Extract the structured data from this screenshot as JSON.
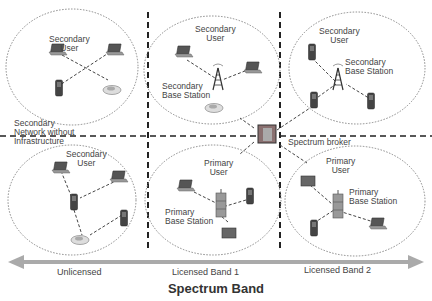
{
  "diagram": {
    "title": "Spectrum Band",
    "bands": [
      "Unlicensed",
      "Licensed Band 1",
      "Licensed Band 2"
    ],
    "cells": [
      {
        "id": "top-left",
        "label": "Secondary User",
        "devices": [
          "laptop",
          "laptop",
          "phone",
          "car"
        ]
      },
      {
        "id": "top-center",
        "label": "Secondary User",
        "station_label": "Secondary Base Station",
        "devices": [
          "laptop",
          "laptop",
          "car"
        ]
      },
      {
        "id": "top-right",
        "label": "Secondary User",
        "station_label": "Secondary Base Station",
        "devices": [
          "phone",
          "phone",
          "phone"
        ]
      },
      {
        "id": "bottom-left",
        "label": "Secondary User",
        "devices": [
          "laptop",
          "laptop",
          "phone",
          "phone",
          "car"
        ]
      },
      {
        "id": "bottom-center",
        "label": "Primary User",
        "station_label": "Primary Base Station",
        "devices": [
          "laptop",
          "phone",
          "tablet"
        ]
      },
      {
        "id": "bottom-right",
        "label": "Primary User",
        "station_label": "Primary Base Station",
        "devices": [
          "tablet",
          "phone",
          "laptop"
        ]
      }
    ],
    "side_label": "Secondary Network without Infrastructure",
    "broker_label": "Spectrum broker"
  },
  "labels": {
    "tl_user": "Secondary",
    "tl_user2": "User",
    "tc_user": "Secondary",
    "tc_user2": "User",
    "tc_bs": "Secondary",
    "tc_bs2": "Base Station",
    "tr_user": "Secondary",
    "tr_user2": "User",
    "tr_bs": "Secondary",
    "tr_bs2": "Base Station",
    "side1": "Secondary",
    "side2": "Network without",
    "side3": "Infrastructure",
    "bl_user": "Secondary",
    "bl_user2": "User",
    "bc_user": "Primary",
    "bc_user2": "User",
    "bc_bs": "Primary",
    "bc_bs2": "Base Station",
    "br_user": "Primary",
    "br_user2": "User",
    "br_bs": "Primary",
    "br_bs2": "Base Station",
    "broker": "Spectrum broker"
  }
}
